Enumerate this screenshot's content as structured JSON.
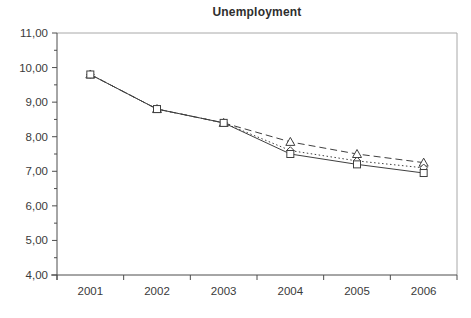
{
  "chart_data": {
    "type": "line",
    "title": "Unemployment",
    "categories": [
      "2001",
      "2002",
      "2003",
      "2004",
      "2005",
      "2006"
    ],
    "series": [
      {
        "name": "triangle-dashed-series",
        "marker": "triangle",
        "line_style": "dashed",
        "values": [
          9.8,
          8.8,
          8.4,
          7.85,
          7.5,
          7.25
        ]
      },
      {
        "name": "diamond-dotted-series",
        "marker": "diamond",
        "line_style": "dotted",
        "values": [
          9.8,
          8.8,
          8.4,
          7.6,
          7.3,
          7.1
        ]
      },
      {
        "name": "square-solid-series",
        "marker": "square",
        "line_style": "solid",
        "values": [
          9.8,
          8.8,
          8.4,
          7.5,
          7.2,
          6.95
        ]
      }
    ],
    "ylim": [
      4,
      11
    ],
    "y_tick_labels": [
      "11,00",
      "10,00",
      "9,00",
      "8,00",
      "7,00",
      "6,00",
      "5,00",
      "4,00"
    ],
    "y_major_step": 1,
    "y_minor_step": 0.5,
    "decimal_separator": ",",
    "xlabel": "",
    "ylabel": "",
    "grid": false,
    "legend": "none"
  },
  "colors": {
    "background": "#ffffff",
    "axis_line": "#4d4d4d",
    "plot_border_light": "#a8a8a8",
    "series_line": "#3f3f3f",
    "marker_fill": "#ffffff",
    "tick_text": "#3a3a3a"
  }
}
